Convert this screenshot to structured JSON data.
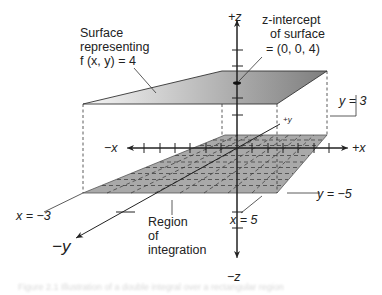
{
  "figure": {
    "type": "3d-double-integral-illustration",
    "colors": {
      "line": "#222222",
      "region_fill": "#aaaaaa",
      "surface_light": "#f4f4f4",
      "surface_dark": "#8a8a8a",
      "background": "#ffffff"
    },
    "axes": {
      "plus_z": "+z",
      "minus_z": "−z",
      "plus_x": "+x",
      "minus_x": "−x",
      "plus_y": "+y",
      "minus_y": "−y"
    },
    "labels": {
      "surface_line1": "Surface",
      "surface_line2": "representing",
      "surface_line3": "f (x, y) = 4",
      "intercept_line1": "z-intercept",
      "intercept_line2": "of surface",
      "intercept_line3": "= (0, 0, 4)",
      "y_eq_3": "y = 3",
      "y_eq_neg5": "y = −5",
      "x_eq_neg3": "x = −3",
      "x_eq_5": "x = 5",
      "region_line1": "Region",
      "region_line2": "of",
      "region_line3": "integration"
    },
    "caption": "Figure 2.1  Illustration of a double integral over a rectangular region"
  }
}
